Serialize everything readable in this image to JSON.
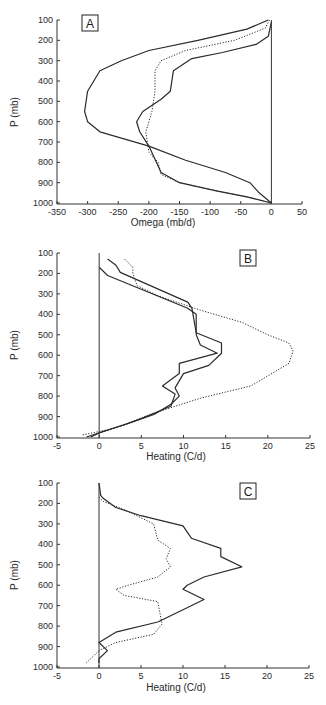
{
  "chart_data": [
    {
      "type": "line",
      "panel_label": "A",
      "xlabel": "Omega (mb/d)",
      "ylabel": "P (mb)",
      "xlim": [
        -350,
        50
      ],
      "ylim": [
        1000,
        100
      ],
      "xticks": [
        -350,
        -300,
        -250,
        -200,
        -150,
        -100,
        -50,
        0,
        50
      ],
      "yticks": [
        100,
        200,
        300,
        400,
        500,
        600,
        700,
        800,
        900,
        1000
      ],
      "vertical_reference_line": 0,
      "grid": false,
      "series": [
        {
          "name": "solid-1",
          "style": "solid",
          "points": [
            [
              -5,
              100
            ],
            [
              -40,
              145
            ],
            [
              -120,
              200
            ],
            [
              -200,
              250
            ],
            [
              -245,
              300
            ],
            [
              -280,
              350
            ],
            [
              -300,
              450
            ],
            [
              -305,
              550
            ],
            [
              -300,
              600
            ],
            [
              -280,
              650
            ],
            [
              -200,
              720
            ],
            [
              -140,
              790
            ],
            [
              -75,
              850
            ],
            [
              -35,
              900
            ],
            [
              -20,
              950
            ],
            [
              0,
              1000
            ]
          ]
        },
        {
          "name": "solid-2",
          "style": "solid",
          "points": [
            [
              0,
              110
            ],
            [
              -5,
              180
            ],
            [
              -25,
              220
            ],
            [
              -80,
              260
            ],
            [
              -130,
              290
            ],
            [
              -160,
              350
            ],
            [
              -165,
              450
            ],
            [
              -180,
              490
            ],
            [
              -210,
              550
            ],
            [
              -220,
              600
            ],
            [
              -215,
              650
            ],
            [
              -200,
              720
            ],
            [
              -180,
              850
            ],
            [
              -150,
              900
            ],
            [
              -90,
              940
            ],
            [
              -40,
              970
            ],
            [
              0,
              1000
            ]
          ]
        },
        {
          "name": "dashed",
          "style": "dotted",
          "points": [
            [
              -3,
              100
            ],
            [
              -10,
              140
            ],
            [
              -60,
              200
            ],
            [
              -140,
              250
            ],
            [
              -180,
              300
            ],
            [
              -190,
              350
            ],
            [
              -190,
              450
            ],
            [
              -195,
              550
            ],
            [
              -200,
              600
            ],
            [
              -205,
              650
            ],
            [
              -200,
              750
            ],
            [
              -185,
              800
            ],
            [
              -180,
              860
            ],
            [
              -150,
              900
            ],
            [
              -90,
              940
            ],
            [
              -40,
              970
            ],
            [
              0,
              1000
            ]
          ]
        }
      ]
    },
    {
      "type": "line",
      "panel_label": "B",
      "xlabel": "Heating (C/d)",
      "ylabel": "P (mb)",
      "xlim": [
        -5,
        25
      ],
      "ylim": [
        1000,
        100
      ],
      "xticks": [
        -5,
        0,
        5,
        10,
        15,
        20,
        25
      ],
      "yticks": [
        100,
        200,
        300,
        400,
        500,
        600,
        700,
        800,
        900,
        1000
      ],
      "vertical_reference_line": 0,
      "grid": false,
      "series": [
        {
          "name": "solid-1",
          "style": "solid",
          "points": [
            [
              1,
              130
            ],
            [
              2,
              160
            ],
            [
              2.5,
              195
            ],
            [
              10.5,
              340
            ],
            [
              11,
              370
            ],
            [
              11.5,
              490
            ],
            [
              14.5,
              540
            ],
            [
              14.5,
              590
            ],
            [
              13,
              650
            ],
            [
              10,
              690
            ],
            [
              9,
              760
            ],
            [
              9.5,
              800
            ],
            [
              8.5,
              840
            ],
            [
              6.5,
              890
            ],
            [
              3,
              940
            ],
            [
              1.5,
              960
            ],
            [
              -1.5,
              1000
            ]
          ]
        },
        {
          "name": "solid-2",
          "style": "solid",
          "points": [
            [
              0,
              170
            ],
            [
              1,
              210
            ],
            [
              10.5,
              370
            ],
            [
              11.5,
              400
            ],
            [
              11.5,
              500
            ],
            [
              12,
              550
            ],
            [
              14,
              590
            ],
            [
              9.5,
              640
            ],
            [
              9.5,
              690
            ],
            [
              7.5,
              750
            ],
            [
              9,
              790
            ],
            [
              8.5,
              850
            ],
            [
              5,
              910
            ],
            [
              3,
              940
            ],
            [
              1.5,
              960
            ],
            [
              0,
              980
            ],
            [
              -1,
              1000
            ]
          ]
        },
        {
          "name": "dashed",
          "style": "dotted",
          "points": [
            [
              3,
              130
            ],
            [
              4,
              170
            ],
            [
              4,
              200
            ],
            [
              4.5,
              260
            ],
            [
              7,
              310
            ],
            [
              12,
              380
            ],
            [
              17,
              440
            ],
            [
              20,
              500
            ],
            [
              22.5,
              540
            ],
            [
              23,
              580
            ],
            [
              22.5,
              640
            ],
            [
              18,
              750
            ],
            [
              12,
              810
            ],
            [
              9,
              850
            ],
            [
              6,
              890
            ],
            [
              3.5,
              930
            ],
            [
              1.5,
              960
            ],
            [
              -2,
              990
            ]
          ]
        }
      ]
    },
    {
      "type": "line",
      "panel_label": "C",
      "xlabel": "Heating (C/d)",
      "ylabel": "P (mb)",
      "xlim": [
        -5,
        25
      ],
      "ylim": [
        1000,
        100
      ],
      "xticks": [
        -5,
        0,
        5,
        10,
        15,
        20,
        25
      ],
      "yticks": [
        100,
        200,
        300,
        400,
        500,
        600,
        700,
        800,
        900,
        1000
      ],
      "vertical_reference_line": 0,
      "grid": false,
      "series": [
        {
          "name": "solid",
          "style": "solid",
          "points": [
            [
              0,
              100
            ],
            [
              0.2,
              160
            ],
            [
              0.5,
              175
            ],
            [
              2,
              220
            ],
            [
              5,
              260
            ],
            [
              10,
              310
            ],
            [
              11,
              370
            ],
            [
              14.5,
              420
            ],
            [
              14.5,
              460
            ],
            [
              17,
              510
            ],
            [
              12.5,
              560
            ],
            [
              10.5,
              600
            ],
            [
              10,
              620
            ],
            [
              12.5,
              670
            ],
            [
              10,
              720
            ],
            [
              7,
              780
            ],
            [
              2,
              830
            ],
            [
              0,
              880
            ],
            [
              1,
              920
            ],
            [
              0,
              960
            ],
            [
              0,
              980
            ]
          ]
        },
        {
          "name": "dashed",
          "style": "dotted",
          "points": [
            [
              0,
              170
            ],
            [
              0.5,
              190
            ],
            [
              3,
              230
            ],
            [
              6.5,
              300
            ],
            [
              7,
              380
            ],
            [
              8.5,
              420
            ],
            [
              8,
              470
            ],
            [
              8.5,
              510
            ],
            [
              7,
              560
            ],
            [
              3.5,
              600
            ],
            [
              2,
              620
            ],
            [
              3,
              650
            ],
            [
              7,
              680
            ],
            [
              7.5,
              790
            ],
            [
              6.5,
              840
            ],
            [
              2,
              880
            ],
            [
              1,
              900
            ],
            [
              0,
              920
            ],
            [
              -1.5,
              980
            ]
          ]
        }
      ]
    }
  ],
  "panels": {
    "a": {
      "label": "A",
      "xlabel": "Omega (mb/d)",
      "ylabel": "P (mb)",
      "xticks": [
        "-350",
        "-300",
        "-250",
        "-200",
        "-150",
        "-100",
        "-50",
        "0",
        "50"
      ],
      "yticks": [
        "100",
        "200",
        "300",
        "400",
        "500",
        "600",
        "700",
        "800",
        "900",
        "1000"
      ]
    },
    "b": {
      "label": "B",
      "xlabel": "Heating (C/d)",
      "ylabel": "P (mb)",
      "xticks": [
        "-5",
        "0",
        "5",
        "10",
        "15",
        "20",
        "25"
      ],
      "yticks": [
        "100",
        "200",
        "300",
        "400",
        "500",
        "600",
        "700",
        "800",
        "900",
        "1000"
      ]
    },
    "c": {
      "label": "C",
      "xlabel": "Heating (C/d)",
      "ylabel": "P (mb)",
      "xticks": [
        "-5",
        "0",
        "5",
        "10",
        "15",
        "20",
        "25"
      ],
      "yticks": [
        "100",
        "200",
        "300",
        "400",
        "500",
        "600",
        "700",
        "800",
        "900",
        "1000"
      ]
    }
  },
  "colors": {
    "line": "#2b2b2b",
    "axis": "#333333",
    "text": "#2a2a2a"
  }
}
